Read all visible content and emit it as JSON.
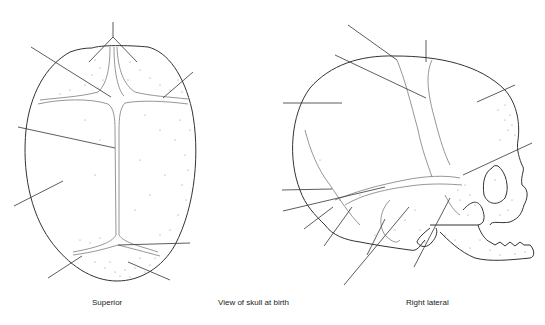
{
  "diagram": {
    "title": "View of skull at birth",
    "views": [
      {
        "id": "superior",
        "caption": "Superior"
      },
      {
        "id": "lateral",
        "caption": "Right lateral"
      }
    ],
    "colors": {
      "outline": "#333333",
      "suture": "#8a8a8a",
      "stipple": "#777777",
      "background": "#ffffff"
    },
    "superior_leader_lines": [
      {
        "x1": 113,
        "y1": 22,
        "x2": 113,
        "y2": 37
      },
      {
        "x1": 113,
        "y1": 37,
        "x2": 89,
        "y2": 62
      },
      {
        "x1": 113,
        "y1": 37,
        "x2": 137,
        "y2": 62
      },
      {
        "x1": 31,
        "y1": 47,
        "x2": 111,
        "y2": 97
      },
      {
        "x1": 193,
        "y1": 72,
        "x2": 163,
        "y2": 98
      },
      {
        "x1": 18,
        "y1": 127,
        "x2": 115,
        "y2": 148
      },
      {
        "x1": 14,
        "y1": 206,
        "x2": 63,
        "y2": 181
      },
      {
        "x1": 118,
        "y1": 245,
        "x2": 190,
        "y2": 243
      },
      {
        "x1": 48,
        "y1": 278,
        "x2": 82,
        "y2": 256
      },
      {
        "x1": 128,
        "y1": 262,
        "x2": 170,
        "y2": 280
      }
    ],
    "lateral_leader_lines": [
      {
        "x1": 348,
        "y1": 25,
        "x2": 397,
        "y2": 60
      },
      {
        "x1": 426,
        "y1": 40,
        "x2": 426,
        "y2": 62
      },
      {
        "x1": 335,
        "y1": 55,
        "x2": 426,
        "y2": 98
      },
      {
        "x1": 283,
        "y1": 103,
        "x2": 342,
        "y2": 103
      },
      {
        "x1": 477,
        "y1": 102,
        "x2": 515,
        "y2": 85
      },
      {
        "x1": 463,
        "y1": 175,
        "x2": 532,
        "y2": 143
      },
      {
        "x1": 282,
        "y1": 190,
        "x2": 332,
        "y2": 189
      },
      {
        "x1": 283,
        "y1": 211,
        "x2": 385,
        "y2": 187
      },
      {
        "x1": 304,
        "y1": 229,
        "x2": 333,
        "y2": 207
      },
      {
        "x1": 324,
        "y1": 246,
        "x2": 352,
        "y2": 207
      },
      {
        "x1": 367,
        "y1": 255,
        "x2": 385,
        "y2": 219
      },
      {
        "x1": 344,
        "y1": 285,
        "x2": 409,
        "y2": 207
      },
      {
        "x1": 414,
        "y1": 267,
        "x2": 450,
        "y2": 198
      }
    ]
  }
}
